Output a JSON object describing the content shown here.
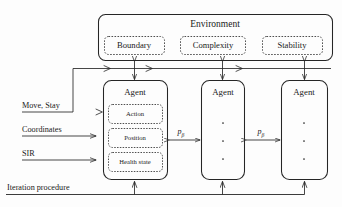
{
  "diagram": {
    "type": "block-diagram",
    "title_visible": false,
    "environment": {
      "label": "Environment",
      "components": [
        {
          "label": "Boundary"
        },
        {
          "label": "Complexity"
        },
        {
          "label": "Stability"
        }
      ]
    },
    "agents": [
      {
        "label": "Agent",
        "attributes": [
          {
            "label": "Action"
          },
          {
            "label": "Position"
          },
          {
            "label": "Health state"
          }
        ],
        "ellipsis": false
      },
      {
        "label": "Agent",
        "attributes": [],
        "ellipsis": true
      },
      {
        "label": "Agent",
        "attributes": [],
        "ellipsis": true
      }
    ],
    "inputs": [
      {
        "label": "Move, Stay"
      },
      {
        "label": "Coordinates"
      },
      {
        "label": "SIR"
      }
    ],
    "bottom_input": {
      "label": "Iteration procedure"
    },
    "interaction_labels": [
      {
        "label": "p",
        "subscript": "β"
      },
      {
        "label": "p",
        "subscript": "β"
      }
    ],
    "colors": {
      "stroke": "#262626",
      "dashed_stroke": "#3b3b3b",
      "text": "#1a1a1a",
      "background": "#fdfdfd"
    }
  }
}
